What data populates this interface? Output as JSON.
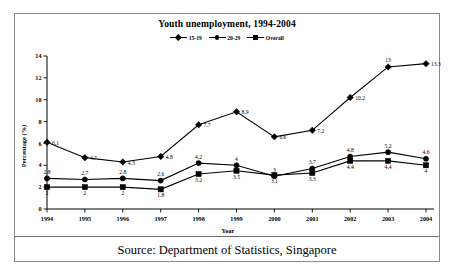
{
  "figure": {
    "source_caption": "Source: Department of Statistics, Singapore"
  },
  "chart_data": {
    "type": "line",
    "title": "Youth unemployment, 1994-2004",
    "xlabel": "Year",
    "ylabel": "Percentage (%)",
    "categories": [
      "1994",
      "1995",
      "1996",
      "1997",
      "1998",
      "1999",
      "2000",
      "2001",
      "2002",
      "2003",
      "2004"
    ],
    "ylim": [
      0,
      14
    ],
    "yticks": [
      "0",
      "2",
      "4",
      "6",
      "8",
      "10",
      "12",
      "14"
    ],
    "grid": false,
    "legend_position": "top-center",
    "series": [
      {
        "name": "15-19",
        "marker": "diamond",
        "values": [
          6.1,
          4.7,
          4.3,
          4.8,
          7.7,
          8.9,
          6.6,
          7.2,
          10.2,
          13,
          13.3
        ],
        "labels": [
          "6.1",
          "4.7",
          "4.3",
          "4.8",
          "7.7",
          "8.9",
          "6.6",
          "7.2",
          "10.2",
          "13",
          "13.3"
        ]
      },
      {
        "name": "20-29",
        "marker": "circle",
        "values": [
          2.8,
          2.7,
          2.8,
          2.6,
          4.2,
          4,
          3,
          3.7,
          4.8,
          5.2,
          4.6
        ],
        "labels": [
          "2.8",
          "2.7",
          "2.8",
          "2.6",
          "4.2",
          "4",
          "3",
          "3.7",
          "4.8",
          "5.2",
          "4.6"
        ]
      },
      {
        "name": "Overall",
        "marker": "square",
        "values": [
          2,
          2,
          2,
          1.8,
          3.2,
          3.5,
          3.1,
          3.3,
          4.4,
          4.4,
          4
        ],
        "labels": [
          "2",
          "2",
          "2",
          "1.8",
          "3.2",
          "3.5",
          "3.1",
          "3.3",
          "4.4",
          "4.4",
          "4"
        ]
      }
    ]
  }
}
